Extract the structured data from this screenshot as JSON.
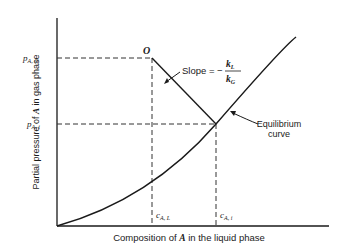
{
  "diagram": {
    "y_axis_label_prefix": "Partial pressure of ",
    "y_axis_label_var": "A",
    "y_axis_label_suffix": " in gas phase",
    "x_axis_label_prefix": "Composition of ",
    "x_axis_label_var": "A",
    "x_axis_label_suffix": " in the liquid phase",
    "y_ticks": [
      {
        "main": "p",
        "sub": "A, G"
      },
      {
        "main": "p",
        "sub": "A, i"
      }
    ],
    "x_ticks": [
      {
        "main": "c",
        "sub": "A, L"
      },
      {
        "main": "c",
        "sub": "A, i"
      }
    ],
    "point_label": "O",
    "slope_label": "Slope = −",
    "slope_numerator": {
      "main": "k",
      "sub": "L"
    },
    "slope_denominator": {
      "main": "k",
      "sub": "G"
    },
    "equilibrium_label_line1": "Equilibrium",
    "equilibrium_label_line2": "curve",
    "colors": {
      "line": "#1a1a1a",
      "background": "#ffffff"
    }
  }
}
